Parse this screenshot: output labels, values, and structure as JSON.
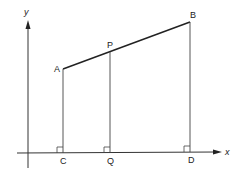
{
  "axes": {
    "x_label": "x",
    "y_label": "y"
  },
  "points": {
    "A": {
      "label": "A"
    },
    "P": {
      "label": "P"
    },
    "B": {
      "label": "B"
    },
    "C": {
      "label": "C"
    },
    "Q": {
      "label": "Q"
    },
    "D": {
      "label": "D"
    }
  },
  "colors": {
    "line": "#222222",
    "background": "#ffffff"
  }
}
